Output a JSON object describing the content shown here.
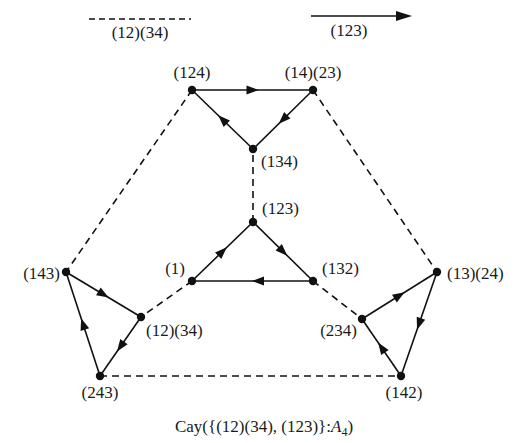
{
  "legend": {
    "dashed_label": "(12)(34)",
    "solid_label": "(123)"
  },
  "caption": {
    "prefix": "Cay({(12)(34), (123)}:",
    "group": "A",
    "subscript": "4",
    "suffix": ")"
  },
  "nodes": [
    {
      "id": "e",
      "label": "(1)",
      "x": 192,
      "y": 281
    },
    {
      "id": "123",
      "label": "(123)",
      "x": 253,
      "y": 222
    },
    {
      "id": "132",
      "label": "(132)",
      "x": 313,
      "y": 281
    },
    {
      "id": "134",
      "label": "(134)",
      "x": 253,
      "y": 149
    },
    {
      "id": "124",
      "label": "(124)",
      "x": 192,
      "y": 90
    },
    {
      "id": "14_23",
      "label": "(14)(23)",
      "x": 313,
      "y": 90
    },
    {
      "id": "143",
      "label": "(143)",
      "x": 66,
      "y": 272
    },
    {
      "id": "12_34",
      "label": "(12)(34)",
      "x": 141,
      "y": 317
    },
    {
      "id": "243",
      "label": "(243)",
      "x": 100,
      "y": 376
    },
    {
      "id": "13_24",
      "label": "(13)(24)",
      "x": 437,
      "y": 272
    },
    {
      "id": "234",
      "label": "(234)",
      "x": 362,
      "y": 319
    },
    {
      "id": "142",
      "label": "(142)",
      "x": 401,
      "y": 376
    }
  ],
  "edges": {
    "solid_directed_123": [
      [
        "e",
        "123"
      ],
      [
        "123",
        "132"
      ],
      [
        "132",
        "e"
      ],
      [
        "124",
        "14_23"
      ],
      [
        "14_23",
        "134"
      ],
      [
        "134",
        "124"
      ],
      [
        "143",
        "12_34"
      ],
      [
        "12_34",
        "243"
      ],
      [
        "243",
        "143"
      ],
      [
        "234",
        "13_24"
      ],
      [
        "13_24",
        "142"
      ],
      [
        "142",
        "234"
      ]
    ],
    "dashed_undirected_12_34": [
      [
        "e",
        "12_34"
      ],
      [
        "123",
        "134"
      ],
      [
        "132",
        "234"
      ],
      [
        "124",
        "143"
      ],
      [
        "14_23",
        "13_24"
      ],
      [
        "243",
        "142"
      ]
    ]
  }
}
